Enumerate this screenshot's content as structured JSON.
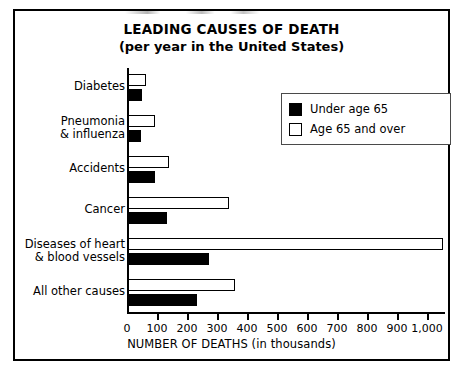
{
  "chart_data": {
    "type": "bar",
    "orientation": "horizontal",
    "title": "LEADING CAUSES OF DEATH",
    "subtitle": "(per year in the United States)",
    "xlabel": "NUMBER OF DEATHS (in thousands)",
    "ylabel": "",
    "xlim": [
      0,
      1000
    ],
    "xticks": [
      0,
      100,
      200,
      300,
      400,
      500,
      600,
      700,
      800,
      900,
      1000
    ],
    "xtick_labels": [
      "0",
      "100",
      "200",
      "300",
      "400",
      "500",
      "600",
      "700",
      "800",
      "900",
      "1,000"
    ],
    "grid": false,
    "legend_position": "upper right",
    "categories": [
      "Diabetes",
      "Pneumonia & influenza",
      "Accidents",
      "Cancer",
      "Diseases of heart & blood vessels",
      "All other causes"
    ],
    "category_labels": [
      [
        "Diabetes"
      ],
      [
        "Pneumonia",
        "& influenza"
      ],
      [
        "Accidents"
      ],
      [
        "Cancer"
      ],
      [
        "Diseases of heart",
        "& blood vessels"
      ],
      [
        "All other causes"
      ]
    ],
    "series": [
      {
        "name": "Age 65 and over",
        "color": "#ffffff",
        "edge_color": "#000000",
        "values": [
          60,
          89,
          136,
          337,
          1050,
          357
        ]
      },
      {
        "name": "Under age 65",
        "color": "#000000",
        "edge_color": "#000000",
        "values": [
          47,
          43,
          90,
          131,
          270,
          230
        ]
      }
    ]
  },
  "legend": {
    "items": [
      {
        "label": "Under age 65",
        "swatch": "filled"
      },
      {
        "label": "Age 65 and over",
        "swatch": "hollow"
      }
    ]
  },
  "colors": {
    "frame": "#000000",
    "under65": "#000000",
    "over65": "#ffffff",
    "text": "#000000",
    "legend_border": "#4a4a4a"
  }
}
